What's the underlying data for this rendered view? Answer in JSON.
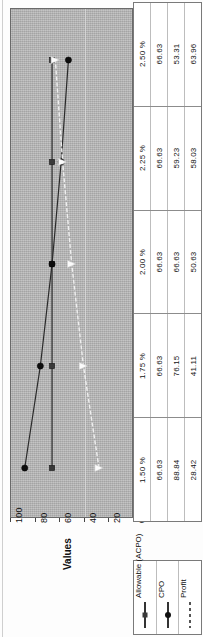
{
  "chart_data": {
    "type": "line",
    "title": "",
    "xlabel": "Promotion % Response",
    "ylabel": "Values",
    "categories": [
      "1.50 %",
      "1.75 %",
      "2.00 %",
      "2.25 %",
      "2.50 %"
    ],
    "ylim": [
      0,
      100
    ],
    "yticks": [
      0,
      20,
      40,
      60,
      80,
      100
    ],
    "ytick_labels": [
      "0",
      "20",
      "40",
      "60",
      "80",
      "100"
    ],
    "grid": true,
    "legend_position": "bottom",
    "orientation": "rotated-90",
    "series": [
      {
        "name": "Allowable (ACPO)",
        "marker": "square",
        "line_style": "solid",
        "color": "#3a3a3a",
        "values": [
          66.63,
          66.63,
          66.63,
          66.63,
          66.63
        ]
      },
      {
        "name": "CPO",
        "marker": "diamond",
        "line_style": "solid",
        "color": "#111111",
        "values": [
          88.84,
          76.15,
          66.63,
          59.23,
          53.31
        ]
      },
      {
        "name": "Profit",
        "marker": "triangle",
        "line_style": "dashed",
        "color": "#f2f2f2",
        "values": [
          28.42,
          41.11,
          50.63,
          58.03,
          63.96
        ]
      }
    ]
  },
  "axis": {
    "value_axis_title": "Values",
    "category_axis_title": "Promotion % Response",
    "ticks": [
      "100",
      "80",
      "60",
      "40",
      "20",
      "0"
    ]
  },
  "table": {
    "rows": [
      {
        "category": "1.50 %",
        "allowable": "66.63",
        "cpo": "88.84",
        "profit": "28.42"
      },
      {
        "category": "1.75 %",
        "allowable": "66.63",
        "cpo": "76.15",
        "profit": "41.11"
      },
      {
        "category": "2.00 %",
        "allowable": "66.63",
        "cpo": "66.63",
        "profit": "50.63"
      },
      {
        "category": "2.25 %",
        "allowable": "66.63",
        "cpo": "59.23",
        "profit": "58.03"
      },
      {
        "category": "2.50 %",
        "allowable": "66.63",
        "cpo": "53.31",
        "profit": "63.96"
      }
    ]
  },
  "legend": {
    "items": [
      {
        "label": "Allowable (ACPO)",
        "marker": "square-marker"
      },
      {
        "label": "CPO",
        "marker": "diamond-marker"
      },
      {
        "label": "Profit",
        "marker": "dashed-line"
      }
    ]
  }
}
